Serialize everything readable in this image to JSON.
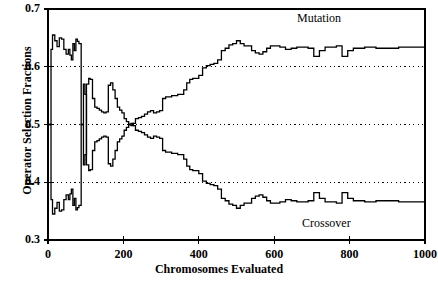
{
  "chart_data": {
    "type": "line",
    "title": "",
    "xlabel": "Chromosomes Evaluated",
    "ylabel": "Operator Selection Fractions",
    "xlim": [
      0,
      1000
    ],
    "ylim": [
      0.3,
      0.7
    ],
    "xticks": [
      0,
      200,
      400,
      600,
      800,
      1000
    ],
    "yticks": [
      0.3,
      0.4,
      0.5,
      0.6,
      0.7
    ],
    "xtick_labels": [
      "0",
      "200",
      "400",
      "600",
      "800",
      "1000"
    ],
    "ytick_labels": [
      "0.3",
      "0.4",
      "0.5",
      "0.6",
      "0.7"
    ],
    "grid": "horizontal-dotted-inner",
    "grid_values": [
      0.4,
      0.5,
      0.6
    ],
    "legend_position": "inline-annotations",
    "line_color": "#000000",
    "series": [
      {
        "name": "Mutation",
        "annotation_label": "Mutation",
        "x": [
          0,
          5,
          8,
          12,
          18,
          24,
          30,
          36,
          42,
          48,
          54,
          58,
          62,
          66,
          70,
          74,
          78,
          82,
          88,
          94,
          98,
          102,
          108,
          112,
          118,
          124,
          130,
          136,
          142,
          148,
          154,
          160,
          166,
          172,
          178,
          184,
          190,
          196,
          202,
          208,
          214,
          220,
          226,
          232,
          240,
          248,
          256,
          264,
          272,
          280,
          288,
          296,
          304,
          312,
          320,
          328,
          336,
          344,
          352,
          360,
          368,
          376,
          384,
          392,
          400,
          410,
          420,
          430,
          440,
          450,
          460,
          470,
          480,
          490,
          500,
          510,
          520,
          530,
          540,
          550,
          560,
          570,
          580,
          590,
          600,
          615,
          630,
          645,
          660,
          675,
          690,
          705,
          720,
          735,
          750,
          765,
          780,
          795,
          810,
          825,
          840,
          855,
          870,
          885,
          900,
          915,
          930,
          945,
          960,
          975,
          990,
          1000
        ],
        "y": [
          0.5,
          0.5,
          0.63,
          0.655,
          0.645,
          0.635,
          0.65,
          0.648,
          0.63,
          0.622,
          0.63,
          0.62,
          0.612,
          0.64,
          0.628,
          0.648,
          0.644,
          0.64,
          0.5,
          0.43,
          0.448,
          0.57,
          0.58,
          0.578,
          0.545,
          0.53,
          0.528,
          0.525,
          0.522,
          0.52,
          0.522,
          0.568,
          0.572,
          0.56,
          0.545,
          0.53,
          0.525,
          0.52,
          0.51,
          0.505,
          0.5,
          0.498,
          0.502,
          0.51,
          0.512,
          0.514,
          0.518,
          0.522,
          0.524,
          0.52,
          0.522,
          0.524,
          0.545,
          0.548,
          0.548,
          0.55,
          0.55,
          0.552,
          0.552,
          0.56,
          0.572,
          0.578,
          0.58,
          0.58,
          0.585,
          0.598,
          0.602,
          0.604,
          0.606,
          0.612,
          0.628,
          0.632,
          0.638,
          0.64,
          0.645,
          0.64,
          0.636,
          0.636,
          0.628,
          0.624,
          0.622,
          0.626,
          0.632,
          0.636,
          0.636,
          0.634,
          0.63,
          0.632,
          0.634,
          0.634,
          0.632,
          0.618,
          0.628,
          0.634,
          0.634,
          0.636,
          0.618,
          0.628,
          0.632,
          0.632,
          0.634,
          0.634,
          0.632,
          0.632,
          0.632,
          0.632,
          0.634,
          0.634,
          0.634,
          0.634,
          0.634,
          0.634
        ]
      },
      {
        "name": "Crossover",
        "annotation_label": "Crossover",
        "x": [
          0,
          5,
          8,
          12,
          18,
          24,
          30,
          36,
          42,
          48,
          54,
          58,
          62,
          66,
          70,
          74,
          78,
          82,
          88,
          94,
          98,
          102,
          108,
          112,
          118,
          124,
          130,
          136,
          142,
          148,
          154,
          160,
          166,
          172,
          178,
          184,
          190,
          196,
          202,
          208,
          214,
          220,
          226,
          232,
          240,
          248,
          256,
          264,
          272,
          280,
          288,
          296,
          304,
          312,
          320,
          328,
          336,
          344,
          352,
          360,
          368,
          376,
          384,
          392,
          400,
          410,
          420,
          430,
          440,
          450,
          460,
          470,
          480,
          490,
          500,
          510,
          520,
          530,
          540,
          550,
          560,
          570,
          580,
          590,
          600,
          615,
          630,
          645,
          660,
          675,
          690,
          705,
          720,
          735,
          750,
          765,
          780,
          795,
          810,
          825,
          840,
          855,
          870,
          885,
          900,
          915,
          930,
          945,
          960,
          975,
          990,
          1000
        ],
        "y": [
          0.5,
          0.5,
          0.37,
          0.345,
          0.355,
          0.365,
          0.35,
          0.352,
          0.37,
          0.378,
          0.37,
          0.38,
          0.388,
          0.36,
          0.372,
          0.352,
          0.356,
          0.36,
          0.5,
          0.57,
          0.552,
          0.43,
          0.42,
          0.422,
          0.455,
          0.47,
          0.472,
          0.475,
          0.478,
          0.48,
          0.478,
          0.432,
          0.428,
          0.44,
          0.455,
          0.47,
          0.475,
          0.48,
          0.49,
          0.495,
          0.5,
          0.502,
          0.498,
          0.49,
          0.488,
          0.486,
          0.482,
          0.478,
          0.476,
          0.48,
          0.478,
          0.476,
          0.455,
          0.452,
          0.452,
          0.45,
          0.45,
          0.448,
          0.448,
          0.44,
          0.428,
          0.422,
          0.42,
          0.42,
          0.415,
          0.402,
          0.398,
          0.396,
          0.394,
          0.388,
          0.372,
          0.368,
          0.362,
          0.36,
          0.355,
          0.36,
          0.364,
          0.364,
          0.372,
          0.376,
          0.378,
          0.374,
          0.368,
          0.364,
          0.364,
          0.366,
          0.37,
          0.368,
          0.366,
          0.366,
          0.368,
          0.382,
          0.372,
          0.366,
          0.366,
          0.364,
          0.382,
          0.372,
          0.368,
          0.368,
          0.366,
          0.366,
          0.368,
          0.368,
          0.368,
          0.368,
          0.366,
          0.366,
          0.366,
          0.366,
          0.366,
          0.366
        ]
      }
    ]
  }
}
